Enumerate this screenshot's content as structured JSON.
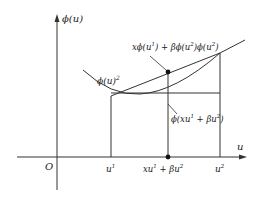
{
  "diagram": {
    "type": "convex-function-illustration",
    "colors": {
      "stroke": "#333333",
      "text": "#222222",
      "background": "#ffffff",
      "point": "#111111"
    },
    "axes": {
      "y_label": "ϕ(u)",
      "x_label": "u",
      "origin_label": "O"
    },
    "x_ticks": {
      "u1": "u",
      "u1_sup": "1",
      "mid_a": "xu",
      "mid_a_sup": "1",
      "mid_b": " + βu",
      "mid_b_sup": "2",
      "u2": "u",
      "u2_sup": "2"
    },
    "annotations": {
      "curve_label": "ϕ(u)",
      "curve_label_sup": "2",
      "chord_label_p1": "xϕ(u",
      "chord_label_s1": "1",
      "chord_label_p2": ") + βϕ(u",
      "chord_label_s2": "2",
      "chord_label_p3": ")ϕ(u",
      "chord_label_s3": "2",
      "chord_label_p4": ")",
      "value_label_p1": "ϕ(xu",
      "value_label_s1": "1",
      "value_label_p2": " + βu",
      "value_label_s2": "2",
      "value_label_p3": ")"
    }
  }
}
